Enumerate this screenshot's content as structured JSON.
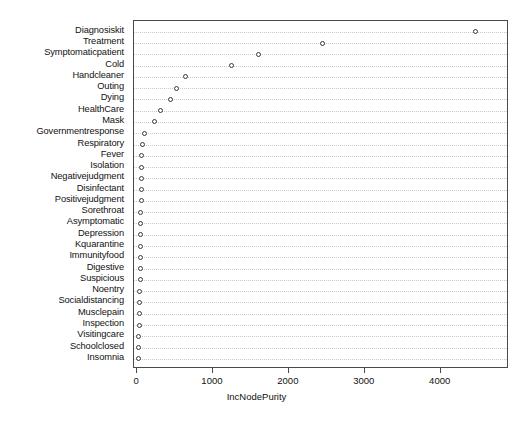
{
  "chart_data": {
    "type": "scatter",
    "title": "",
    "subtitle": "",
    "xlabel": "IncNodePurity",
    "ylabel": "",
    "orientation": "horizontal",
    "grid": true,
    "grid_style": "dotted-horizontal",
    "legend": "none",
    "marker": "open-circle",
    "xlim": [
      -40,
      4900
    ],
    "xticks": [
      0,
      1000,
      2000,
      3000,
      4000
    ],
    "xticklabels": [
      "0",
      "1000",
      "2000",
      "3000",
      "4000"
    ],
    "categories": [
      "Diagnosiskit",
      "Treatment",
      "Symptomaticpatient",
      "Cold",
      "Handcleaner",
      "Outing",
      "Dying",
      "HealthCare",
      "Mask",
      "Governmentresponse",
      "Respiratory",
      "Fever",
      "Isolation",
      "Negativejudgment",
      "Disinfectant",
      "Positivejudgment",
      "Sorethroat",
      "Asymptomatic",
      "Depression",
      "Kquarantine",
      "Immunityfood",
      "Digestive",
      "Suspicious",
      "Noentry",
      "Socialdistancing",
      "Musclepain",
      "Inspection",
      "Visitingcare",
      "Schoolclosed",
      "Insomnia"
    ],
    "values": [
      4462,
      2442,
      1597,
      1241,
      634,
      515,
      436,
      304,
      224,
      92,
      66,
      62,
      60,
      58,
      56,
      54,
      52,
      50,
      48,
      46,
      44,
      42,
      40,
      38,
      36,
      30,
      26,
      22,
      18,
      14
    ],
    "colors": {
      "marker_edge": "#3a3a3a",
      "marker_fill": "#ffffff",
      "grid": "#c8c8c8",
      "frame": "#4a4a4a",
      "text": "#111111",
      "background": "#ffffff"
    }
  },
  "axis": {
    "x_title": "IncNodePurity"
  }
}
